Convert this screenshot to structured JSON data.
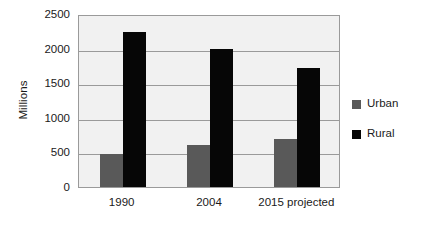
{
  "chart_data": {
    "type": "bar",
    "title": "",
    "xlabel": "",
    "ylabel": "Millions",
    "categories": [
      "1990",
      "2004",
      "2015 projected"
    ],
    "series": [
      {
        "name": "Urban",
        "color": "#595959",
        "values": [
          480,
          610,
          700
        ]
      },
      {
        "name": "Rural",
        "color": "#060606",
        "values": [
          2240,
          2000,
          1720
        ]
      }
    ],
    "ylim": [
      0,
      2500
    ],
    "y_ticks": [
      0,
      500,
      1000,
      1500,
      2000,
      2500
    ],
    "y_tick_labels": [
      "0",
      "500",
      "1000",
      "1500",
      "2000",
      "2500"
    ],
    "grid": true,
    "grid_axis": "y",
    "legend_position": "right",
    "plot_background": "#f1f1f1",
    "plot_border": "#9a9a9a",
    "gridline_color": "#9a9a9a"
  },
  "legend": {
    "entries": [
      {
        "label": "Urban",
        "color": "#595959"
      },
      {
        "label": "Rural",
        "color": "#060606"
      }
    ]
  }
}
